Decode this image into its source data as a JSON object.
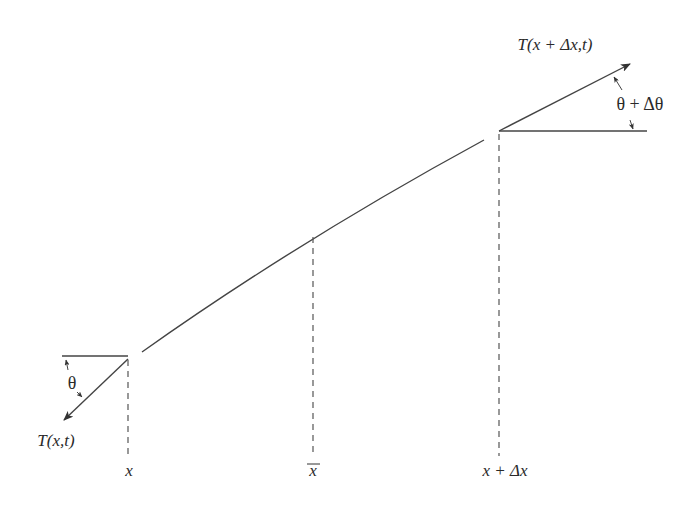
{
  "diagram": {
    "type": "string-element-tension",
    "labels": {
      "tension_left": "T(x,t)",
      "tension_right": "T(x + Δx,t)",
      "angle_left": "θ",
      "angle_right": "θ + Δθ",
      "x_left": "x",
      "x_mid": "x",
      "x_mid_overline": true,
      "x_right": "x + Δx"
    },
    "colors": {
      "stroke": "#333333",
      "background": "#ffffff"
    }
  }
}
